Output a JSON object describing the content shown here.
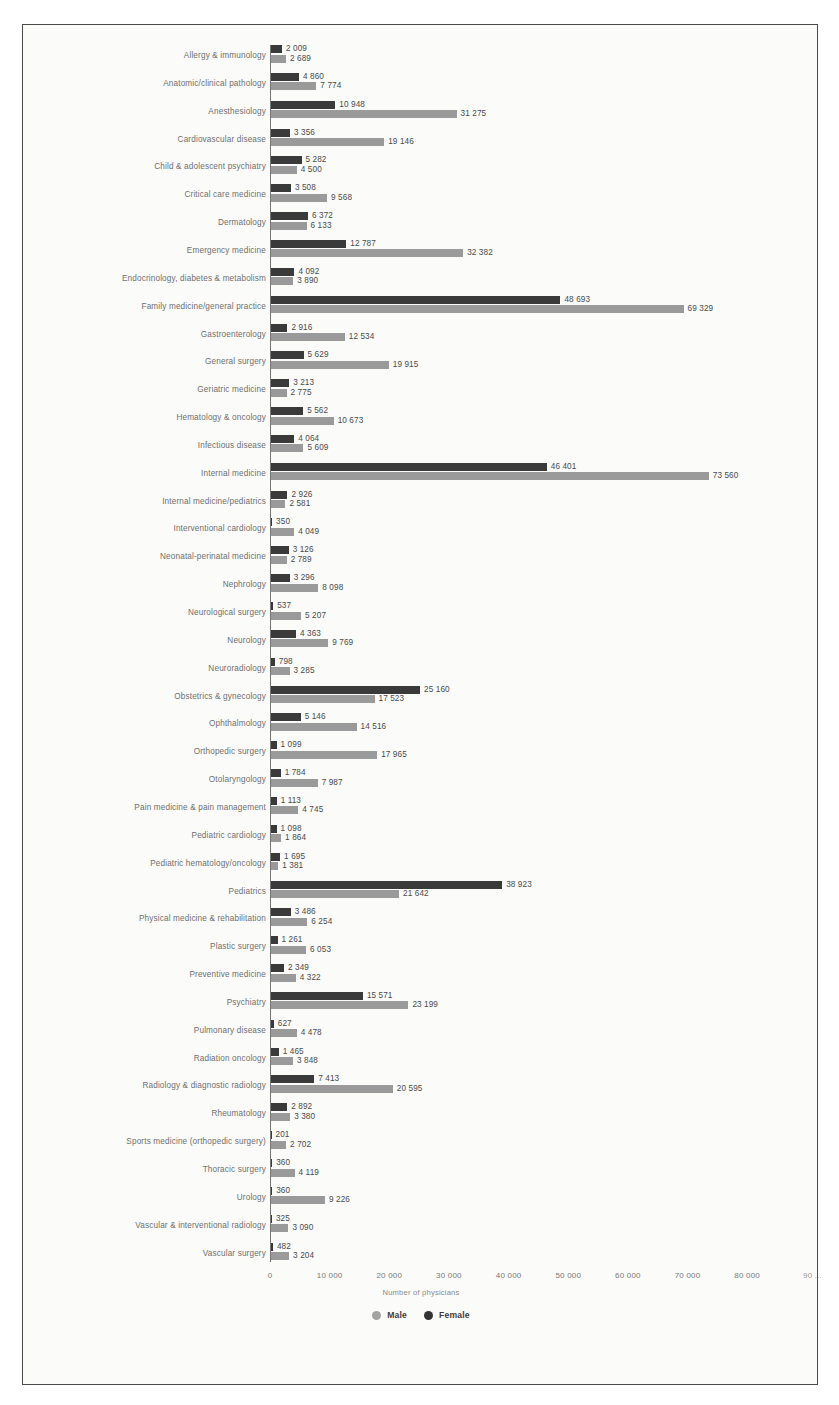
{
  "chart_data": {
    "type": "bar",
    "orientation": "horizontal",
    "title": "",
    "xlabel": "Number of physicians",
    "ylabel": "",
    "xlim": [
      0,
      90000
    ],
    "xticks": [
      0,
      10000,
      20000,
      30000,
      40000,
      50000,
      60000,
      70000,
      80000,
      90000
    ],
    "xtick_labels": [
      "0",
      "10 000",
      "20 000",
      "30 000",
      "40 000",
      "50 000",
      "60 000",
      "70 000",
      "80 000",
      "90 ..."
    ],
    "grid": false,
    "legend_position": "bottom",
    "legend": [
      "Male",
      "Female"
    ],
    "colors": {
      "male": "#9a9a9a",
      "female": "#3a3a3a",
      "frame": "#4a4a4a",
      "background": "#fbfbfa"
    },
    "categories": [
      "Allergy & immunology",
      "Anatomic/clinical pathology",
      "Anesthesiology",
      "Cardiovascular disease",
      "Child & adolescent psychiatry",
      "Critical care medicine",
      "Dermatology",
      "Emergency medicine",
      "Endocrinology, diabetes & metabolism",
      "Family medicine/general practice",
      "Gastroenterology",
      "General surgery",
      "Geriatric medicine",
      "Hematology & oncology",
      "Infectious disease",
      "Internal medicine",
      "Internal medicine/pediatrics",
      "Interventional cardiology",
      "Neonatal-perinatal medicine",
      "Nephrology",
      "Neurological surgery",
      "Neurology",
      "Neuroradiology",
      "Obstetrics & gynecology",
      "Ophthalmology",
      "Orthopedic surgery",
      "Otolaryngology",
      "Pain medicine & pain management",
      "Pediatric cardiology",
      "Pediatric hematology/oncology",
      "Pediatrics",
      "Physical medicine & rehabilitation",
      "Plastic surgery",
      "Preventive medicine",
      "Psychiatry",
      "Pulmonary disease",
      "Radiation oncology",
      "Radiology & diagnostic radiology",
      "Rheumatology",
      "Sports medicine (orthopedic surgery)",
      "Thoracic surgery",
      "Urology",
      "Vascular & interventional radiology",
      "Vascular surgery"
    ],
    "series": [
      {
        "name": "Female",
        "color": "#3a3a3a",
        "values": [
          2009,
          4860,
          10948,
          3356,
          5282,
          3508,
          6372,
          12787,
          4092,
          48693,
          2916,
          5629,
          3213,
          5562,
          4064,
          46401,
          2926,
          350,
          3126,
          3296,
          537,
          4363,
          798,
          25160,
          5146,
          1099,
          1784,
          1113,
          1098,
          1695,
          38923,
          3486,
          1261,
          2349,
          15571,
          627,
          1465,
          7413,
          2892,
          201,
          360,
          360,
          325,
          482
        ],
        "labels": [
          "2 009",
          "4 860",
          "10 948",
          "3 356",
          "5 282",
          "3 508",
          "6 372",
          "12 787",
          "4 092",
          "48 693",
          "2 916",
          "5 629",
          "3 213",
          "5 562",
          "4 064",
          "46 401",
          "2 926",
          "350",
          "3 126",
          "3 296",
          "537",
          "4 363",
          "798",
          "25 160",
          "5 146",
          "1 099",
          "1 784",
          "1 113",
          "1 098",
          "1 695",
          "38 923",
          "3 486",
          "1 261",
          "2 349",
          "15 571",
          "627",
          "1 465",
          "7 413",
          "2 892",
          "201",
          "360",
          "360",
          "325",
          "482"
        ]
      },
      {
        "name": "Male",
        "color": "#9a9a9a",
        "values": [
          2689,
          7774,
          31275,
          19146,
          4500,
          9568,
          6133,
          32382,
          3890,
          69329,
          12534,
          19915,
          2775,
          10673,
          5609,
          73560,
          2581,
          4049,
          2789,
          8098,
          5207,
          9769,
          3285,
          17523,
          14516,
          17965,
          7987,
          4745,
          1864,
          1381,
          21642,
          6254,
          6053,
          4322,
          23199,
          4478,
          3848,
          20595,
          3380,
          2702,
          4119,
          9226,
          3090,
          3204
        ],
        "labels": [
          "2 689",
          "7 774",
          "31 275",
          "19 146",
          "4 500",
          "9 568",
          "6 133",
          "32 382",
          "3 890",
          "69 329",
          "12 534",
          "19 915",
          "2 775",
          "10 673",
          "5 609",
          "73 560",
          "2 581",
          "4 049",
          "2 789",
          "8 098",
          "5 207",
          "9 769",
          "3 285",
          "17 523",
          "14 516",
          "17 965",
          "7 987",
          "4 745",
          "1 864",
          "1 381",
          "21 642",
          "6 254",
          "6 053",
          "4 322",
          "23 199",
          "4 478",
          "3 848",
          "20 595",
          "3 380",
          "2 702",
          "4 119",
          "9 226",
          "3 090",
          "3 204"
        ]
      }
    ]
  }
}
